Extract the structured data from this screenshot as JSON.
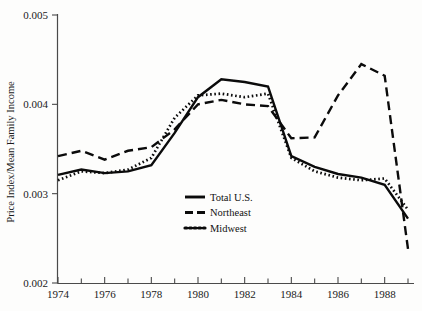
{
  "chart_data": {
    "type": "line",
    "title": "",
    "subtitle": "",
    "xlabel": "",
    "ylabel": "Price Index/Mean Family Income",
    "xlim": [
      1974,
      1989
    ],
    "ylim": [
      0.002,
      0.005
    ],
    "y_ticks": [
      "0.002",
      "0.003",
      "0.004",
      "0.005"
    ],
    "y_tick_values": [
      0.002,
      0.003,
      0.004,
      0.005
    ],
    "x_ticks_labeled": [
      "1974",
      "1976",
      "1978",
      "1980",
      "1982",
      "1984",
      "1986",
      "1988"
    ],
    "x_tick_values_labeled": [
      1974,
      1976,
      1978,
      1980,
      1982,
      1984,
      1986,
      1988
    ],
    "x_ticks_minor": [
      1975,
      1977,
      1979,
      1981,
      1983,
      1985,
      1987,
      1989
    ],
    "grid": false,
    "legend_position": "center-bottom-left",
    "x": [
      1974,
      1975,
      1976,
      1977,
      1978,
      1979,
      1980,
      1981,
      1982,
      1983,
      1984,
      1985,
      1986,
      1987,
      1988,
      1989
    ],
    "series": [
      {
        "name": "Total U.S.",
        "style": "solid",
        "color": "#0b0b0b",
        "values": [
          0.00321,
          0.00327,
          0.00323,
          0.00325,
          0.00332,
          0.00368,
          0.00408,
          0.00428,
          0.00425,
          0.0042,
          0.00342,
          0.0033,
          0.00322,
          0.00318,
          0.0031,
          0.00272
        ]
      },
      {
        "name": "Northeast",
        "style": "dashed",
        "color": "#0b0b0b",
        "values": [
          0.00342,
          0.00348,
          0.00338,
          0.00348,
          0.00352,
          0.00372,
          0.004,
          0.00405,
          0.004,
          0.00398,
          0.00362,
          0.00363,
          0.0041,
          0.00445,
          0.00432,
          0.00238
        ]
      },
      {
        "name": "Midwest",
        "style": "dotted",
        "color": "#0b0b0b",
        "values": [
          0.00315,
          0.00325,
          0.00323,
          0.00327,
          0.0034,
          0.00385,
          0.0041,
          0.00412,
          0.00408,
          0.00412,
          0.0034,
          0.00325,
          0.00318,
          0.00315,
          0.00317,
          0.00282
        ]
      }
    ]
  },
  "axes": {
    "ylabel": "Price Index/Mean Family Income"
  },
  "legend": {
    "entries": [
      {
        "label": "Total U.S.",
        "style": "solid"
      },
      {
        "label": "Northeast",
        "style": "dashed"
      },
      {
        "label": "Midwest",
        "style": "dotted"
      }
    ]
  }
}
